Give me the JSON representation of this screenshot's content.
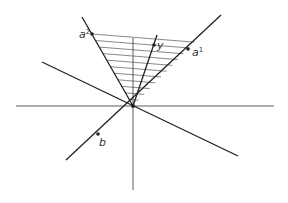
{
  "diagram": {
    "title": "",
    "origin": [
      133,
      106
    ],
    "colors": {
      "line": "#222222",
      "axis": "#333333",
      "hatch": "#555555",
      "background": "#ffffff"
    },
    "axes": {
      "horizontal": [
        16,
        106,
        274,
        106
      ],
      "vertical": [
        133,
        38,
        133,
        190
      ]
    },
    "lines": [
      {
        "id": "line-a1-b",
        "coords": [
          66,
          160,
          221,
          15
        ]
      },
      {
        "id": "line-diagonal",
        "coords": [
          42,
          62,
          238,
          156
        ]
      },
      {
        "id": "ray-a2",
        "coords": [
          82,
          17,
          133,
          106
        ]
      },
      {
        "id": "ray-y",
        "coords": [
          157,
          35,
          133,
          106
        ]
      }
    ],
    "points": [
      {
        "id": "a2",
        "label": "a",
        "sup": "2",
        "x": 92,
        "y": 34,
        "lx": 79,
        "ly": 38
      },
      {
        "id": "y",
        "label": "y",
        "sup": "",
        "x": 154,
        "y": 45,
        "lx": 157,
        "ly": 49
      },
      {
        "id": "a1",
        "label": "a",
        "sup": "1",
        "x": 188,
        "y": 49,
        "lx": 192,
        "ly": 56
      },
      {
        "id": "b",
        "label": "b",
        "sup": "",
        "x": 98,
        "y": 134,
        "lx": 99,
        "ly": 146
      }
    ],
    "hatching": {
      "count": 11,
      "region": "cone between rays a2 and a1"
    }
  }
}
